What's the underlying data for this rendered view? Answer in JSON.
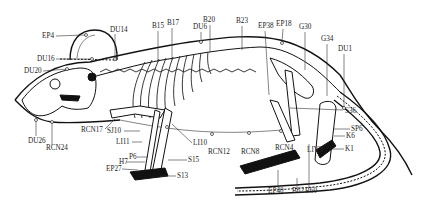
{
  "figure": {
    "labels": [
      {
        "id": "EP4",
        "text": "EP4",
        "x": 42,
        "y": 38
      },
      {
        "id": "DU14",
        "text": "DU14",
        "x": 110,
        "y": 32
      },
      {
        "id": "DU16",
        "text": "DU16",
        "x": 37,
        "y": 61
      },
      {
        "id": "DU20",
        "text": "DU20",
        "x": 24,
        "y": 73
      },
      {
        "id": "B15",
        "text": "B15",
        "x": 152,
        "y": 28
      },
      {
        "id": "B17",
        "text": "B17",
        "x": 167,
        "y": 25
      },
      {
        "id": "DU6",
        "text": "DU6",
        "x": 193,
        "y": 29
      },
      {
        "id": "B20",
        "text": "B20",
        "x": 203,
        "y": 22
      },
      {
        "id": "B23",
        "text": "B23",
        "x": 236,
        "y": 23
      },
      {
        "id": "EP38",
        "text": "EP38",
        "x": 258,
        "y": 28
      },
      {
        "id": "EP18",
        "text": "EP18",
        "x": 276,
        "y": 26
      },
      {
        "id": "G30",
        "text": "G30",
        "x": 299,
        "y": 29
      },
      {
        "id": "G34",
        "text": "G34",
        "x": 321,
        "y": 41
      },
      {
        "id": "DU1",
        "text": "DU1",
        "x": 338,
        "y": 51
      },
      {
        "id": "S36",
        "text": "S36",
        "x": 345,
        "y": 113
      },
      {
        "id": "SP6",
        "text": "SP6",
        "x": 351,
        "y": 131
      },
      {
        "id": "K6",
        "text": "K6",
        "x": 346,
        "y": 138
      },
      {
        "id": "K1",
        "text": "K1",
        "x": 345,
        "y": 151
      },
      {
        "id": "LIV3",
        "text": "LIV3",
        "x": 307,
        "y": 152
      },
      {
        "id": "RCN4",
        "text": "RCN4",
        "x": 275,
        "y": 150
      },
      {
        "id": "RCN8",
        "text": "RCN8",
        "x": 241,
        "y": 154
      },
      {
        "id": "RCN12",
        "text": "RCN12",
        "x": 208,
        "y": 154
      },
      {
        "id": "LI10",
        "text": "LI10",
        "x": 193,
        "y": 145
      },
      {
        "id": "S15",
        "text": "S15",
        "x": 188,
        "y": 162
      },
      {
        "id": "S13",
        "text": "S13",
        "x": 177,
        "y": 178
      },
      {
        "id": "RCN17",
        "text": "RCN17",
        "x": 81,
        "y": 132
      },
      {
        "id": "SJ10",
        "text": "SJ10",
        "x": 107,
        "y": 133
      },
      {
        "id": "LI11",
        "text": "LI11",
        "x": 116,
        "y": 144
      },
      {
        "id": "P6",
        "text": "P6",
        "x": 129,
        "y": 159
      },
      {
        "id": "H7",
        "text": "H7",
        "x": 119,
        "y": 164
      },
      {
        "id": "EP27",
        "text": "EP27",
        "x": 106,
        "y": 171
      },
      {
        "id": "DU26",
        "text": "DU26",
        "x": 28,
        "y": 143
      },
      {
        "id": "RCN24",
        "text": "RCN24",
        "x": 46,
        "y": 150
      },
      {
        "id": "EP40",
        "text": "EP40",
        "x": 268,
        "y": 193
      },
      {
        "id": "B62",
        "text": "B62",
        "x": 292,
        "y": 193
      },
      {
        "id": "B60",
        "text": "B60",
        "x": 305,
        "y": 193
      }
    ]
  }
}
